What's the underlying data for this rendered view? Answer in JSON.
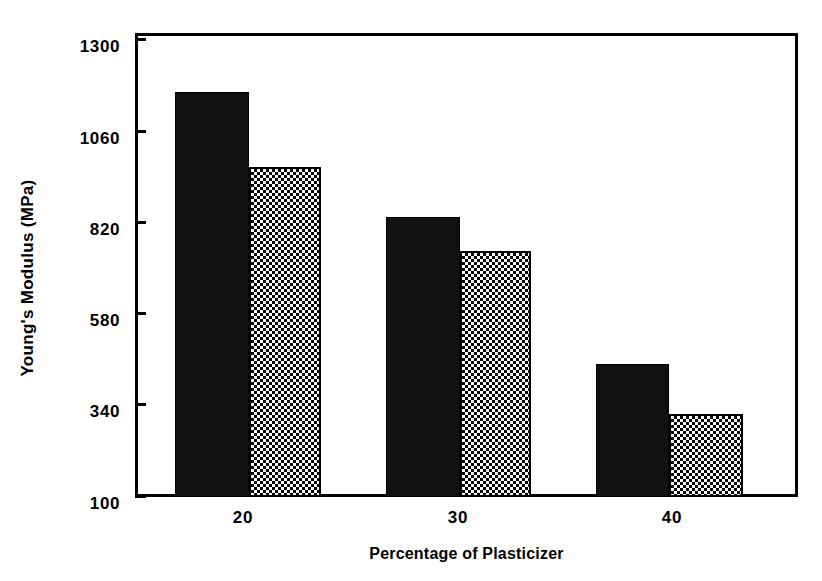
{
  "chart_data": {
    "type": "bar",
    "title": "",
    "xlabel": "Percentage of Plasticizer",
    "ylabel": "Young's Modulus (MPa)",
    "categories": [
      "20",
      "30",
      "40"
    ],
    "series": [
      {
        "name": "series-1-solid-black",
        "fill": "solid-black",
        "values": [
          1158,
          832,
          447
        ]
      },
      {
        "name": "series-2-checkered",
        "fill": "checkerboard",
        "values": [
          964,
          743,
          318
        ]
      }
    ],
    "ylim": [
      100,
      1300
    ],
    "yticks": [
      "1300",
      "1060",
      "820",
      "580",
      "340",
      "100"
    ],
    "ytick_values": [
      1300,
      1060,
      820,
      580,
      340,
      100
    ],
    "xticks": [
      "20",
      "30",
      "40"
    ],
    "grid": false,
    "legend": "none",
    "colors": {
      "series_1": "#111111",
      "series_2_pattern_fg": "#000000",
      "series_2_pattern_bg": "#ffffff",
      "axis": "#000000",
      "background": "#ffffff"
    }
  }
}
